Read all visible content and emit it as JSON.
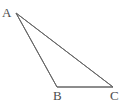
{
  "figure": {
    "type": "geometry-diagram",
    "shape_name": "triangle",
    "canvas": {
      "width": 128,
      "height": 107,
      "background": "#ffffff"
    },
    "stroke": {
      "color": "#666666",
      "width": 1
    },
    "label_color": "#4d4d4d",
    "vertices": [
      {
        "id": "A",
        "label": "A",
        "x": 16,
        "y": 13,
        "label_x": 2,
        "label_y": 6
      },
      {
        "id": "B",
        "label": "B",
        "x": 57,
        "y": 87,
        "label_x": 53,
        "label_y": 89
      },
      {
        "id": "C",
        "label": "C",
        "x": 113,
        "y": 87,
        "label_x": 110,
        "label_y": 89
      }
    ],
    "edges": [
      {
        "id": "AB",
        "from": "A",
        "to": "B",
        "label": ""
      },
      {
        "id": "AC",
        "from": "A",
        "to": "C",
        "label": ""
      },
      {
        "id": "BC",
        "from": "B",
        "to": "C",
        "label": ""
      }
    ],
    "polygon_points": "16,13 57,87 113,87"
  }
}
